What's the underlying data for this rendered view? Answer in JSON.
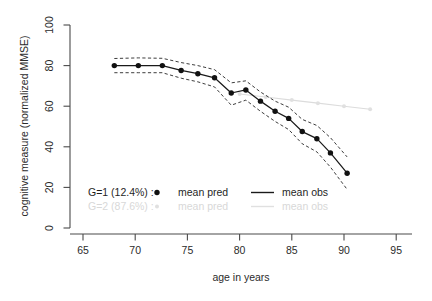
{
  "chart_data": {
    "type": "line",
    "title": "",
    "xlabel": "age in years",
    "ylabel": "cognitive measure (normalized MMSE)",
    "xlim": [
      63.2,
      96.8
    ],
    "ylim": [
      -4,
      104
    ],
    "xticks": [
      65,
      70,
      75,
      80,
      85,
      90,
      95
    ],
    "yticks": [
      0,
      20,
      40,
      60,
      80,
      100
    ],
    "grid": false,
    "legend_position": "bottom-left",
    "series": [
      {
        "name": "G=1 mean obs",
        "group": "G=1",
        "role": "mean obs",
        "style": "solid-line",
        "color": "#1a1a1a",
        "x": [
          68.0,
          70.3,
          72.6,
          74.4,
          76.0,
          77.6,
          79.2,
          80.6,
          82.0,
          83.4,
          84.7,
          86.0,
          87.4,
          88.7,
          90.3
        ],
        "y": [
          80.0,
          80.0,
          80.0,
          77.6,
          76.0,
          74.0,
          66.5,
          68.0,
          62.5,
          57.5,
          54.0,
          47.5,
          44.0,
          37.0,
          27.0
        ]
      },
      {
        "name": "G=1 mean pred",
        "group": "G=1",
        "role": "mean pred",
        "style": "points",
        "color": "#111111",
        "x": [
          68.0,
          70.3,
          72.6,
          74.4,
          76.0,
          77.6,
          79.2,
          80.6,
          82.0,
          83.4,
          84.7,
          86.0,
          87.4,
          88.7,
          90.3
        ],
        "y": [
          80.0,
          80.0,
          80.0,
          77.6,
          76.0,
          74.0,
          66.5,
          68.0,
          62.5,
          57.5,
          54.0,
          47.5,
          44.0,
          37.0,
          27.0
        ]
      },
      {
        "name": "G=1 upper CI",
        "group": "G=1",
        "role": "confidence-upper",
        "style": "dashed-line",
        "color": "#1a1a1a",
        "x": [
          68.0,
          70.3,
          72.6,
          74.4,
          76.0,
          77.6,
          79.2,
          80.6,
          82.0,
          83.4,
          84.7,
          86.0,
          87.4,
          88.7,
          90.3
        ],
        "y": [
          83.5,
          83.8,
          83.6,
          81.5,
          80.0,
          78.0,
          71.5,
          72.5,
          67.0,
          62.5,
          59.5,
          53.5,
          50.5,
          44.5,
          35.0
        ]
      },
      {
        "name": "G=1 lower CI",
        "group": "G=1",
        "role": "confidence-lower",
        "style": "dashed-line",
        "color": "#1a1a1a",
        "x": [
          68.0,
          70.3,
          72.6,
          74.4,
          76.0,
          77.6,
          79.2,
          80.6,
          82.0,
          83.4,
          84.7,
          86.0,
          87.4,
          88.7,
          90.3
        ],
        "y": [
          76.5,
          76.5,
          76.5,
          73.8,
          72.0,
          69.5,
          60.5,
          63.0,
          57.5,
          52.5,
          48.5,
          41.5,
          37.5,
          30.0,
          19.0
        ]
      },
      {
        "name": "G=2 mean obs",
        "group": "G=2",
        "role": "mean obs",
        "style": "solid-line",
        "color": "#dcdcdc",
        "x": [
          80.0,
          82.5,
          85.0,
          87.5,
          90.0,
          92.5
        ],
        "y": [
          66.0,
          64.5,
          63.0,
          61.5,
          60.0,
          58.5
        ]
      },
      {
        "name": "G=2 mean pred",
        "group": "G=2",
        "role": "mean pred",
        "style": "points",
        "color": "#e0e0e0",
        "x": [
          80.0,
          82.5,
          85.0,
          87.5,
          90.0,
          92.5
        ],
        "y": [
          66.0,
          64.5,
          63.0,
          61.5,
          60.0,
          58.5
        ]
      }
    ],
    "legend": [
      {
        "group_label": "G=1 (12.4%) :",
        "pred_label": "mean pred",
        "obs_label": "mean obs",
        "muted": false
      },
      {
        "group_label": "G=2 (87.6%) :",
        "pred_label": "mean pred",
        "obs_label": "mean obs",
        "muted": true
      }
    ]
  }
}
